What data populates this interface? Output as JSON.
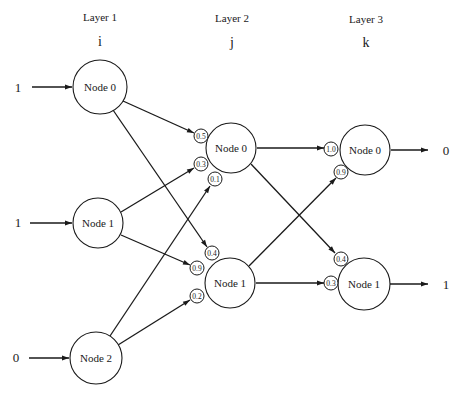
{
  "layers": [
    {
      "title": "Layer 1",
      "index": "i"
    },
    {
      "title": "Layer 2",
      "index": "j"
    },
    {
      "title": "Layer 3",
      "index": "k"
    }
  ],
  "inputs": [
    "1",
    "1",
    "0"
  ],
  "outputs": [
    "0",
    "1"
  ],
  "nodes": {
    "layer1": [
      "Node 0",
      "Node 1",
      "Node 2"
    ],
    "layer2": [
      "Node 0",
      "Node 1"
    ],
    "layer3": [
      "Node 0",
      "Node 1"
    ]
  },
  "weights": {
    "layer2_node0": [
      "0.5",
      "0.3",
      "0.1"
    ],
    "layer2_node1": [
      "0.4",
      "0.9",
      "0.2"
    ],
    "layer3_node0": [
      "1.0",
      "0.9"
    ],
    "layer3_node1": [
      "0.4",
      "0.3"
    ]
  },
  "connections": [
    {
      "from": "L1-Node0",
      "to": "L2-Node0",
      "weight": "0.5"
    },
    {
      "from": "L1-Node1",
      "to": "L2-Node0",
      "weight": "0.3"
    },
    {
      "from": "L1-Node2",
      "to": "L2-Node0",
      "weight": "0.1"
    },
    {
      "from": "L1-Node0",
      "to": "L2-Node1",
      "weight": "0.4"
    },
    {
      "from": "L1-Node1",
      "to": "L2-Node1",
      "weight": "0.9"
    },
    {
      "from": "L1-Node2",
      "to": "L2-Node1",
      "weight": "0.2"
    },
    {
      "from": "L2-Node0",
      "to": "L3-Node0",
      "weight": "1.0"
    },
    {
      "from": "L2-Node1",
      "to": "L3-Node0",
      "weight": "0.9"
    },
    {
      "from": "L2-Node0",
      "to": "L3-Node1",
      "weight": "0.4"
    },
    {
      "from": "L2-Node1",
      "to": "L3-Node1",
      "weight": "0.3"
    }
  ]
}
